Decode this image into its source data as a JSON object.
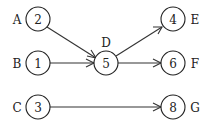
{
  "diagram": {
    "type": "directed-graph",
    "nodes": [
      {
        "id": "A",
        "value": "2",
        "letter": "A",
        "x": 38,
        "y": 19
      },
      {
        "id": "B",
        "value": "1",
        "letter": "B",
        "x": 38,
        "y": 63
      },
      {
        "id": "C",
        "value": "3",
        "letter": "C",
        "x": 38,
        "y": 107
      },
      {
        "id": "D",
        "value": "5",
        "letter": "D",
        "x": 106,
        "y": 63
      },
      {
        "id": "E",
        "value": "4",
        "letter": "E",
        "x": 173,
        "y": 19
      },
      {
        "id": "F",
        "value": "6",
        "letter": "F",
        "x": 173,
        "y": 63
      },
      {
        "id": "G",
        "value": "8",
        "letter": "G",
        "x": 173,
        "y": 107
      }
    ],
    "edges": [
      {
        "from": "A",
        "to": "D"
      },
      {
        "from": "B",
        "to": "D"
      },
      {
        "from": "D",
        "to": "E"
      },
      {
        "from": "D",
        "to": "F"
      },
      {
        "from": "C",
        "to": "G"
      }
    ],
    "colors": {
      "stroke": "#222222",
      "background": "#ffffff"
    }
  }
}
